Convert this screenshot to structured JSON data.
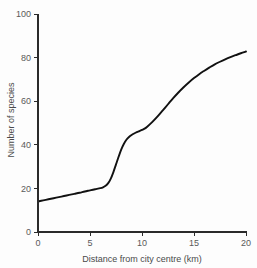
{
  "chart_data": {
    "type": "line",
    "title": "",
    "subtitle": "",
    "xlabel": "Distance from city centre (km)",
    "ylabel": "Number of species",
    "xlim": [
      0,
      20
    ],
    "ylim": [
      0,
      100
    ],
    "xticks": [
      0,
      5,
      10,
      15,
      20
    ],
    "yticks": [
      0,
      20,
      40,
      60,
      80,
      100
    ],
    "xtick_labels": [
      "0",
      "5",
      "10",
      "15",
      "20"
    ],
    "ytick_labels": [
      "0",
      "20",
      "40",
      "60",
      "80",
      "100"
    ],
    "grid": false,
    "legend": null,
    "legend_position": "none",
    "annotations": [],
    "series": [
      {
        "name": "Number of species",
        "color": "#111111",
        "line_width": 1.9,
        "marker": "none",
        "x": [
          0,
          0.5,
          1,
          1.5,
          2,
          2.5,
          3,
          3.5,
          4,
          4.5,
          5,
          5.5,
          6,
          6.25,
          6.5,
          6.75,
          7,
          7.25,
          7.5,
          7.75,
          8,
          8.25,
          8.5,
          8.75,
          9,
          9.25,
          9.5,
          9.75,
          10,
          10.25,
          10.5,
          11,
          11.5,
          12,
          12.5,
          13,
          13.5,
          14,
          14.5,
          15,
          15.5,
          16,
          16.5,
          17,
          17.5,
          18,
          18.5,
          19,
          19.5,
          20
        ],
        "y": [
          14.0,
          14.5,
          15.0,
          15.5,
          16.0,
          16.5,
          17.0,
          17.5,
          18.0,
          18.6,
          19.1,
          19.6,
          20.1,
          20.5,
          21.2,
          22.4,
          24.5,
          27.5,
          31.0,
          34.5,
          37.8,
          40.4,
          42.3,
          43.6,
          44.5,
          45.2,
          45.8,
          46.3,
          46.8,
          47.4,
          48.3,
          50.5,
          53.0,
          55.8,
          58.6,
          61.4,
          64.0,
          66.4,
          68.6,
          70.6,
          72.4,
          74.0,
          75.5,
          76.9,
          78.1,
          79.2,
          80.2,
          81.1,
          82.0,
          82.8
        ]
      }
    ]
  },
  "axes": {
    "y_title": "Number of species",
    "x_title": "Distance from city centre (km)"
  },
  "style": {
    "curve_color": "#111111",
    "axis_color": "#2b2b2b",
    "text_color": "#5a5a5a",
    "background_color": "#fdfdfd"
  }
}
